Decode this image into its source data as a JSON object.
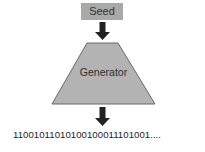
{
  "diagram": {
    "seed_label": "Seed",
    "generator_label": "Generator",
    "output_sequence": "11001011010100100011101001....",
    "colors": {
      "seed_fill": "#a9a9a9",
      "generator_fill": "#b3b3b3",
      "generator_stroke": "#6a6a6a",
      "arrow": "#222222"
    }
  }
}
